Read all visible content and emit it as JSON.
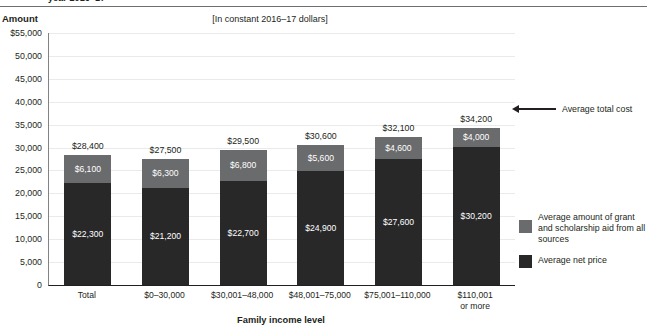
{
  "clipped_title": "year 2016–17",
  "axis_title": "Amount",
  "bracket_note": "[In constant 2016–17 dollars]",
  "xaxis_title": "Family income level",
  "annotation": {
    "label": "Average total cost",
    "icon": "left-arrow-icon"
  },
  "legend": {
    "items": [
      {
        "label": "Average amount of grant and scholarship aid from all sources",
        "color": "#6a6b6d",
        "swatch_name": "legend-swatch-grant"
      },
      {
        "label": "Average net price",
        "color": "#282829",
        "swatch_name": "legend-swatch-net-price"
      }
    ]
  },
  "chart_data": {
    "type": "bar",
    "subtype": "stacked",
    "title": "year 2016–17",
    "subtitle": "[In constant 2016–17 dollars]",
    "xlabel": "Family income level",
    "ylabel": "Amount",
    "ylim": [
      0,
      55000
    ],
    "ytick_step": 5000,
    "grid": true,
    "legend_position": "right",
    "ytick_labels": [
      "$55,000",
      "50,000",
      "45,000",
      "40,000",
      "35,000",
      "30,000",
      "25,000",
      "20,000",
      "15,000",
      "10,000",
      "5,000",
      "0"
    ],
    "ytick_values": [
      55000,
      50000,
      45000,
      40000,
      35000,
      30000,
      25000,
      20000,
      15000,
      10000,
      5000,
      0
    ],
    "categories": [
      "Total",
      "$0–30,000",
      "$30,001–48,000",
      "$48,001–75,000",
      "$75,001–110,000",
      "$110,001 or more"
    ],
    "category_lines": [
      [
        "Total"
      ],
      [
        "$0–30,000"
      ],
      [
        "$30,001–48,000"
      ],
      [
        "$48,001–75,000"
      ],
      [
        "$75,001–110,000"
      ],
      [
        "$110,001",
        "or more"
      ]
    ],
    "series": [
      {
        "name": "Average net price",
        "color": "#282829",
        "values": [
          22300,
          21200,
          22700,
          24900,
          27600,
          30200
        ],
        "labels": [
          "$22,300",
          "$21,200",
          "$22,700",
          "$24,900",
          "$27,600",
          "$30,200"
        ]
      },
      {
        "name": "Average amount of grant and scholarship aid from all sources",
        "color": "#6a6b6d",
        "values": [
          6100,
          6300,
          6800,
          5600,
          4600,
          4000
        ],
        "labels": [
          "$6,100",
          "$6,300",
          "$6,800",
          "$5,600",
          "$4,600",
          "$4,000"
        ]
      }
    ],
    "totals": [
      28400,
      27500,
      29500,
      30600,
      32100,
      34200
    ],
    "total_labels": [
      "$28,400",
      "$27,500",
      "$29,500",
      "$30,600",
      "$32,100",
      "$34,200"
    ],
    "annotations": [
      {
        "text": "Average total cost",
        "target_category": "$110,001 or more",
        "target_value": 34200
      }
    ]
  }
}
